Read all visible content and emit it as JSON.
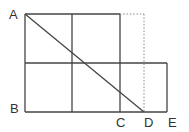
{
  "diagram": {
    "type": "geometry-figure",
    "colors": {
      "line": "#444444",
      "dotted": "#888888",
      "text": "#333333",
      "background": "#ffffff"
    },
    "labels": {
      "A": "A",
      "B": "B",
      "C": "C",
      "D": "D",
      "E": "E"
    },
    "points": {
      "A": [
        25,
        14
      ],
      "B": [
        25,
        112
      ],
      "C": [
        120,
        112
      ],
      "D": [
        144,
        112
      ],
      "E": [
        167,
        112
      ]
    },
    "segments": [
      {
        "from": "A",
        "to": "D",
        "style": "solid",
        "role": "diagonal"
      }
    ]
  }
}
